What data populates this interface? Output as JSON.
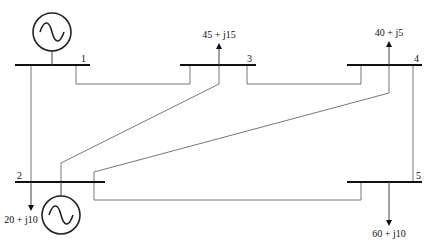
{
  "diagram": {
    "type": "five-bus power system one-line diagram",
    "buses": [
      {
        "id": "1",
        "label": "1",
        "has_generator": true
      },
      {
        "id": "2",
        "label": "2",
        "has_generator": true
      },
      {
        "id": "3",
        "label": "3",
        "has_generator": false
      },
      {
        "id": "4",
        "label": "4",
        "has_generator": false
      },
      {
        "id": "5",
        "label": "5",
        "has_generator": false
      }
    ],
    "loads": [
      {
        "bus": "3",
        "label": "45 + j15"
      },
      {
        "bus": "4",
        "label": "40 + j5"
      },
      {
        "bus": "2",
        "label": "20 + j10"
      },
      {
        "bus": "5",
        "label": "60 + j10"
      }
    ],
    "lines": [
      {
        "from": "1",
        "to": "3"
      },
      {
        "from": "1",
        "to": "2"
      },
      {
        "from": "3",
        "to": "4"
      },
      {
        "from": "3",
        "to": "2"
      },
      {
        "from": "4",
        "to": "2"
      },
      {
        "from": "4",
        "to": "5"
      },
      {
        "from": "2",
        "to": "5"
      }
    ],
    "generators": [
      {
        "bus": "1",
        "icon": "ac-source-icon"
      },
      {
        "bus": "2",
        "icon": "ac-source-icon"
      }
    ]
  }
}
